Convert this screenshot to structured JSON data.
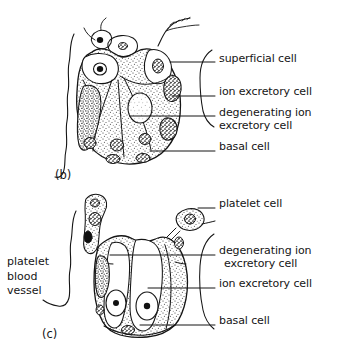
{
  "figure": {
    "background_color": "#ffffff",
    "ink_color": "#151515"
  },
  "panels": [
    {
      "id": "panel-b",
      "tag": "(b)",
      "tag_x": 55,
      "tag_y": 174,
      "labels": [
        {
          "name": "superficial-cell",
          "text": "superficial cell",
          "x": 219,
          "y": 59
        },
        {
          "name": "ion-excretory-cell",
          "text": "ion excretory cell",
          "x": 219,
          "y": 92
        },
        {
          "name": "degenerating-line-1",
          "text": "degenerating ion",
          "x": 219,
          "y": 113
        },
        {
          "name": "degenerating-line-2",
          "text": "excretory cell",
          "x": 219,
          "y": 126
        },
        {
          "name": "basal-cell",
          "text": "basal cell",
          "x": 219,
          "y": 147
        }
      ]
    },
    {
      "id": "panel-c",
      "tag": "(c)",
      "tag_x": 42,
      "tag_y": 333,
      "side_label": {
        "name": "platelet-blood-vessel",
        "lines": [
          "platelet",
          "blood",
          "vessel"
        ],
        "x": 7,
        "y": 261
      },
      "labels": [
        {
          "name": "platelet-cell",
          "text": "platelet cell",
          "x": 219,
          "y": 204
        },
        {
          "name": "degenerating-line-1",
          "text": "degenerating ion",
          "x": 219,
          "y": 251
        },
        {
          "name": "degenerating-line-2",
          "text": "excretory cell",
          "x": 224,
          "y": 264
        },
        {
          "name": "ion-excretory-cell",
          "text": "ion excretory cell",
          "x": 219,
          "y": 284
        },
        {
          "name": "basal-cell",
          "text": "basal cell",
          "x": 219,
          "y": 321
        }
      ]
    }
  ]
}
